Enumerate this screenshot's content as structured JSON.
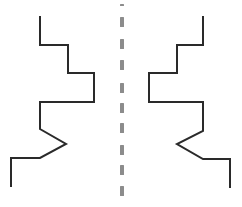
{
  "title": "Mirror symmetry: stepped line figure and its reflection",
  "colors": {
    "background": "#ffffff",
    "stroke": "#2a2a2a",
    "axis": "#8c8c8c"
  },
  "stroke_width": 2,
  "figures": {
    "left": {
      "label": "Original figure",
      "points": "40,16 40,45 68,45 68,73 94,73 94,102 40,102 40,129 66,144 40,158 11,158 11,187"
    },
    "right": {
      "label": "Mirrored figure",
      "points": "203,16 203,45 177,45 177,73 149,73 149,102 203,102 203,131 177,144 203,159 230,159 230,188"
    }
  },
  "axis": {
    "label": "Line of symmetry",
    "x": 120,
    "width": 4,
    "dashes": [
      {
        "top": 4,
        "height": 2
      },
      {
        "top": 17,
        "height": 10
      },
      {
        "top": 39,
        "height": 10
      },
      {
        "top": 60,
        "height": 10
      },
      {
        "top": 83,
        "height": 10
      },
      {
        "top": 103,
        "height": 10
      },
      {
        "top": 123,
        "height": 10
      },
      {
        "top": 145,
        "height": 10
      },
      {
        "top": 165,
        "height": 10
      },
      {
        "top": 186,
        "height": 10
      }
    ]
  }
}
